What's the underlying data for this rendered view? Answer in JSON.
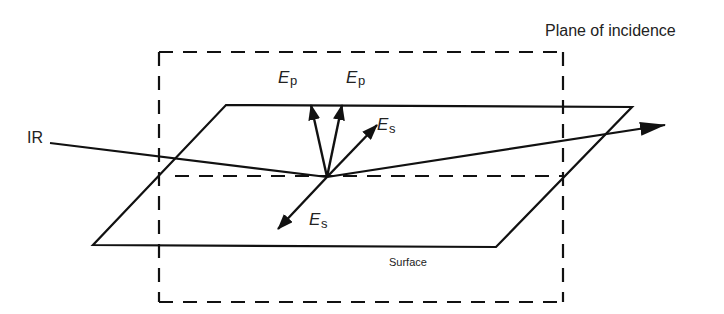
{
  "diagram": {
    "title_label": "Plane of incidence",
    "incident_label": "IR",
    "surface_label": "Surface",
    "field_labels": {
      "ep_left": {
        "main": "E",
        "sub": "p"
      },
      "ep_right": {
        "main": "E",
        "sub": "p"
      },
      "es_up": {
        "main": "E",
        "sub": "s"
      },
      "es_down": {
        "main": "E",
        "sub": "s"
      }
    },
    "colors": {
      "line": "#111111",
      "text": "#222222",
      "background": "#ffffff"
    }
  }
}
